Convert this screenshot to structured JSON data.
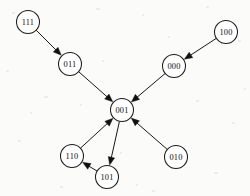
{
  "figure": {
    "kind": "directed-state-transition-graph",
    "width": 250,
    "height": 196,
    "background_color": "#fbfbfa",
    "ink_color": "#171717",
    "node_fill_color": "#ffffff",
    "node_radius": 11.5
  },
  "nodes": [
    {
      "id": "n111",
      "label": "111",
      "x": 28,
      "y": 22
    },
    {
      "id": "n011",
      "label": "011",
      "x": 70,
      "y": 64
    },
    {
      "id": "n100",
      "label": "100",
      "x": 226,
      "y": 32
    },
    {
      "id": "n000",
      "label": "000",
      "x": 174,
      "y": 66
    },
    {
      "id": "n001",
      "label": "001",
      "x": 122,
      "y": 110
    },
    {
      "id": "n110",
      "label": "110",
      "x": 72,
      "y": 156
    },
    {
      "id": "n101",
      "label": "101",
      "x": 107,
      "y": 177
    },
    {
      "id": "n010",
      "label": "010",
      "x": 176,
      "y": 157
    }
  ],
  "edges": [
    {
      "id": "e1",
      "from": "111",
      "to": "011",
      "from_id": "n111",
      "to_id": "n011"
    },
    {
      "id": "e2",
      "from": "011",
      "to": "001",
      "from_id": "n011",
      "to_id": "n001"
    },
    {
      "id": "e3",
      "from": "100",
      "to": "000",
      "from_id": "n100",
      "to_id": "n000"
    },
    {
      "id": "e4",
      "from": "000",
      "to": "001",
      "from_id": "n000",
      "to_id": "n001"
    },
    {
      "id": "e5",
      "from": "010",
      "to": "001",
      "from_id": "n010",
      "to_id": "n001"
    },
    {
      "id": "e6",
      "from": "110",
      "to": "001",
      "from_id": "n110",
      "to_id": "n001"
    },
    {
      "id": "e7",
      "from": "001",
      "to": "101",
      "from_id": "n001",
      "to_id": "n101"
    },
    {
      "id": "e8",
      "from": "101",
      "to": "110",
      "from_id": "n101",
      "to_id": "n110"
    }
  ],
  "chart_data": {
    "type": "diagram",
    "title": "",
    "node_labels": [
      "111",
      "011",
      "100",
      "000",
      "001",
      "110",
      "101",
      "010"
    ],
    "edge_list": [
      [
        "111",
        "011"
      ],
      [
        "011",
        "001"
      ],
      [
        "100",
        "000"
      ],
      [
        "000",
        "001"
      ],
      [
        "010",
        "001"
      ],
      [
        "110",
        "001"
      ],
      [
        "001",
        "101"
      ],
      [
        "101",
        "110"
      ]
    ],
    "in_degree": {
      "111": 0,
      "011": 1,
      "100": 0,
      "000": 1,
      "001": 4,
      "110": 1,
      "101": 1,
      "010": 0
    },
    "out_degree": {
      "111": 1,
      "011": 1,
      "100": 1,
      "000": 1,
      "001": 1,
      "110": 1,
      "101": 1,
      "010": 1
    },
    "legend": [],
    "annotations": []
  }
}
